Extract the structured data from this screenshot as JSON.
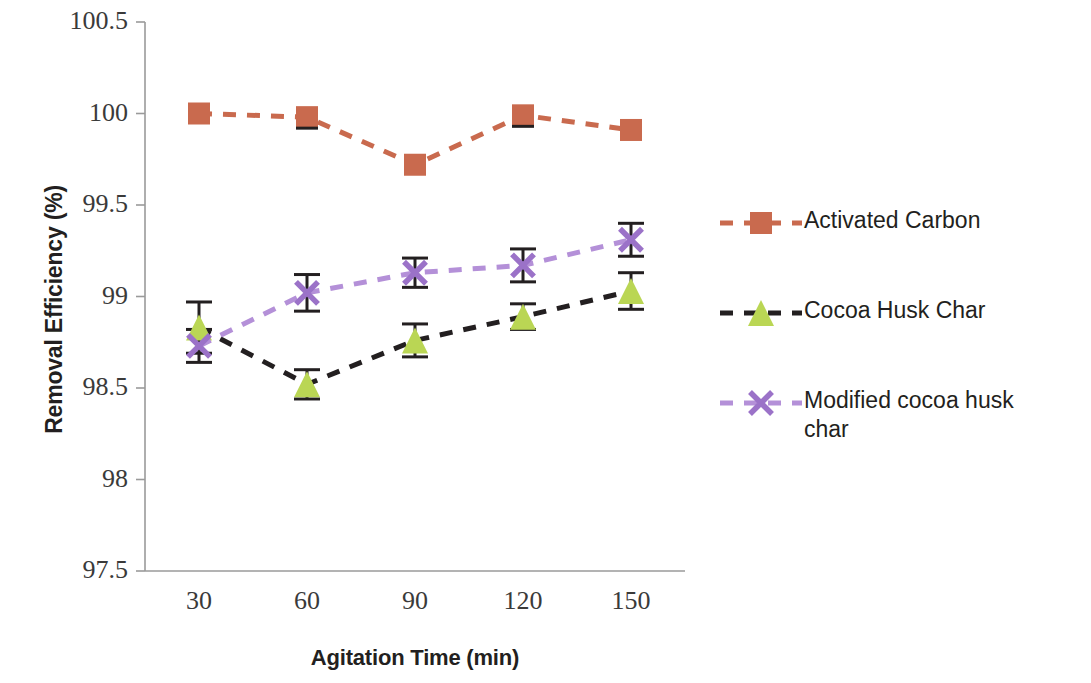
{
  "chart_data": {
    "type": "line",
    "title": "",
    "xlabel": "Agitation Time (min)",
    "ylabel": "Removal Efficiency (%)",
    "categories": [
      "30",
      "60",
      "90",
      "120",
      "150"
    ],
    "x": [
      30,
      60,
      90,
      120,
      150
    ],
    "ylim": [
      97.5,
      100.5
    ],
    "xlim": [
      15,
      165
    ],
    "yticks": [
      "97.5",
      "98",
      "98.5",
      "99",
      "99.5",
      "100",
      "100.5"
    ],
    "ytick_values": [
      97.5,
      98,
      98.5,
      99,
      99.5,
      100,
      100.5
    ],
    "grid": false,
    "legend_position": "right",
    "series": [
      {
        "name": "Activated Carbon",
        "marker": "square",
        "color": "#c96a4e",
        "line_color": "#c96a4e",
        "line_style": "dashed",
        "values": [
          100.0,
          99.98,
          99.72,
          99.99,
          99.91
        ],
        "errors": [
          0.0,
          0.0,
          0.0,
          0.0,
          0.0
        ]
      },
      {
        "name": "Cocoa Husk Char",
        "marker": "triangle",
        "color": "#bad654",
        "line_color": "#231f20",
        "line_style": "dashed",
        "values": [
          98.83,
          98.52,
          98.76,
          98.89,
          99.03
        ],
        "errors": [
          0.14,
          0.08,
          0.09,
          0.07,
          0.1
        ]
      },
      {
        "name": "Modified cocoa husk char",
        "marker": "x",
        "color": "#9b72c8",
        "line_color": "#b490d8",
        "line_style": "dashed",
        "values": [
          98.73,
          99.02,
          99.13,
          99.17,
          99.31
        ],
        "errors": [
          0.09,
          0.1,
          0.08,
          0.09,
          0.09
        ]
      }
    ]
  },
  "legend": {
    "items": [
      {
        "label": "Activated Carbon"
      },
      {
        "label": "Cocoa Husk Char"
      },
      {
        "label": "Modified cocoa husk char"
      }
    ]
  },
  "axes": {
    "y_title": "Removal Efficiency (%)",
    "x_title": "Agitation Time (min)"
  }
}
